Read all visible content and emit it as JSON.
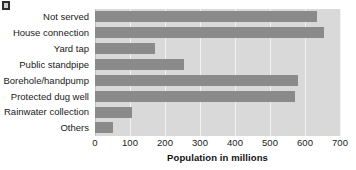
{
  "chart_data": {
    "type": "bar",
    "orientation": "horizontal",
    "title": "",
    "xlabel": "Population in millions",
    "ylabel": "",
    "categories": [
      "Not served",
      "House connection",
      "Yard tap",
      "Public standpipe",
      "Borehole/handpump",
      "Protected dug well",
      "Rainwater collection",
      "Others"
    ],
    "values": [
      635,
      655,
      170,
      255,
      580,
      570,
      105,
      50
    ],
    "xlim": [
      0,
      700
    ],
    "xticks": [
      0,
      100,
      200,
      300,
      400,
      500,
      600,
      700
    ],
    "xtick_labels": [
      "0",
      "100",
      "200",
      "300",
      "400",
      "500",
      "600",
      "700"
    ],
    "grid": true,
    "grid_axis": "x",
    "legend": false,
    "colors": {
      "bar": "#8a8a8a",
      "plot_background": "#d9d9d9",
      "gridline": "#f2f2f2",
      "text": "#1a1a1a",
      "figure_background": "#ffffff"
    }
  }
}
